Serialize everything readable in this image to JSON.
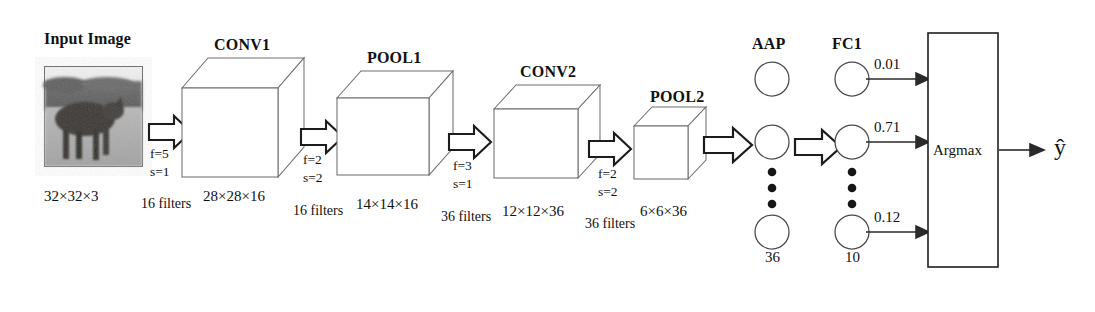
{
  "figure": {
    "type": "cnn-architecture-diagram",
    "background": "#ffffff",
    "line_color": "#3a3a3a",
    "text_color": "#111111"
  },
  "input": {
    "title": "Input Image",
    "dims": "32×32×3",
    "image_alt": "horse-photo-grayscale"
  },
  "ops": [
    {
      "name": "conv1-op",
      "f": "f=5",
      "s": "s=1",
      "filters": "16 filters"
    },
    {
      "name": "pool1-op",
      "f": "f=2",
      "s": "s=2",
      "filters": "16 filters"
    },
    {
      "name": "conv2-op",
      "f": "f=3",
      "s": "s=1",
      "filters": "36 filters"
    },
    {
      "name": "pool2-op",
      "f": "f=2",
      "s": "s=2",
      "filters": "36 filters"
    }
  ],
  "layers": [
    {
      "name": "conv1",
      "title": "CONV1",
      "dims": "28×28×16"
    },
    {
      "name": "pool1",
      "title": "POOL1",
      "dims": "14×14×16"
    },
    {
      "name": "conv2",
      "title": "CONV2",
      "dims": "12×12×36"
    },
    {
      "name": "pool2",
      "title": "POOL2",
      "dims": "6×6×36"
    }
  ],
  "aap": {
    "title": "AAP",
    "count": "36"
  },
  "fc1": {
    "title": "FC1",
    "count": "10",
    "probabilities": [
      "0.01",
      "0.71",
      "0.12"
    ]
  },
  "argmax": {
    "label": "Argmax"
  },
  "output": {
    "label": "ŷ"
  }
}
